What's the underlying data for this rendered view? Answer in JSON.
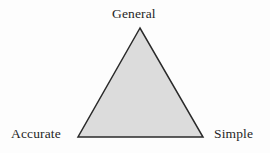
{
  "figure": {
    "name": "design-tradeoff-triangle",
    "background_color": "#fdfdfd"
  },
  "chart_data": {
    "type": "diagram",
    "shape": "triangle",
    "title": "",
    "fill_color": "#dcdcdc",
    "stroke_color": "#2a2a2a",
    "stroke_width": 1.5,
    "vertices": [
      {
        "id": "general",
        "label": "General",
        "x": 140,
        "y": 28,
        "label_position": "top"
      },
      {
        "id": "accurate",
        "label": "Accurate",
        "x": 78,
        "y": 137,
        "label_position": "bottom-left"
      },
      {
        "id": "simple",
        "label": "Simple",
        "x": 203,
        "y": 137,
        "label_position": "bottom-right"
      }
    ],
    "labels": {
      "apex": "General",
      "bottom_left": "Accurate",
      "bottom_right": "Simple"
    }
  }
}
